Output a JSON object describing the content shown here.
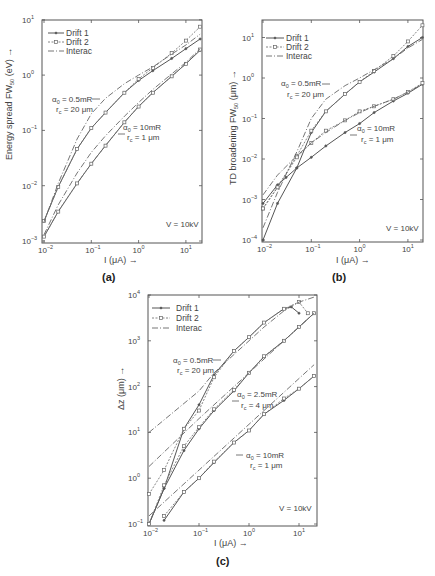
{
  "chart_data": [
    {
      "id": "a",
      "type": "line",
      "panel_label": "(a)",
      "title": "",
      "xlabel": "I (μA) →",
      "ylabel": "Energy spread FW50 (eV) →",
      "xscale": "log",
      "yscale": "log",
      "xlim": [
        0.009,
        22
      ],
      "ylim": [
        0.001,
        10
      ],
      "xticks": [
        "10^-2",
        "10^-1",
        "10^0",
        "10^1"
      ],
      "yticks": [
        "10^-3",
        "10^-2",
        "10^-1",
        "10^0",
        "10^1"
      ],
      "legend": [
        "Drift 1",
        "Drift 2",
        "Interac"
      ],
      "legend_position": "upper left",
      "annotations": [
        {
          "text": "α0 = 0.5mR",
          "sub": "rc = 20 μm"
        },
        {
          "text": "α0 = 10mR",
          "sub": "rc = 1 μm"
        },
        {
          "text": "V = 10kV"
        }
      ],
      "series": [
        {
          "name": "Drift 1 (α0=0.5mR)",
          "x": [
            0.01,
            0.02,
            0.05,
            0.1,
            0.2,
            0.5,
            1,
            2,
            5,
            10,
            20
          ],
          "y": [
            0.0023,
            0.0095,
            0.046,
            0.11,
            0.21,
            0.48,
            0.8,
            1.2,
            2.0,
            3.0,
            4.5
          ]
        },
        {
          "name": "Drift 2 (α0=0.5mR)",
          "x": [
            0.01,
            0.02,
            0.05,
            0.1,
            0.2,
            0.5,
            1,
            2,
            5,
            10,
            20
          ],
          "y": [
            0.0023,
            0.0095,
            0.046,
            0.11,
            0.21,
            0.48,
            0.85,
            1.35,
            2.5,
            4.2,
            7.5
          ]
        },
        {
          "name": "Interac (α0=0.5mR)",
          "x": [
            0.01,
            0.02,
            0.05,
            0.1,
            0.2,
            0.5,
            1,
            2,
            5,
            10,
            20
          ],
          "y": [
            0.0022,
            0.011,
            0.07,
            0.2,
            0.38,
            0.7,
            1.0,
            1.4,
            2.4,
            3.5,
            5.5
          ]
        },
        {
          "name": "Drift 1 (α0=10mR)",
          "x": [
            0.01,
            0.02,
            0.05,
            0.1,
            0.2,
            0.5,
            1,
            2,
            5,
            10,
            20
          ],
          "y": [
            0.0012,
            0.0034,
            0.011,
            0.025,
            0.053,
            0.14,
            0.27,
            0.48,
            0.95,
            1.6,
            2.8
          ]
        },
        {
          "name": "Drift 2 (α0=10mR)",
          "x": [
            0.01,
            0.02,
            0.05,
            0.1,
            0.2,
            0.5,
            1,
            2,
            5,
            10,
            20
          ],
          "y": [
            0.0012,
            0.0034,
            0.011,
            0.025,
            0.053,
            0.14,
            0.27,
            0.48,
            0.95,
            1.6,
            2.9
          ]
        },
        {
          "name": "Interac (α0=10mR)",
          "x": [
            0.01,
            0.02,
            0.05,
            0.1,
            0.2,
            0.5,
            1,
            2,
            5,
            10,
            20
          ],
          "y": [
            0.0013,
            0.0045,
            0.017,
            0.04,
            0.08,
            0.18,
            0.32,
            0.55,
            1.05,
            1.7,
            3.0
          ]
        }
      ]
    },
    {
      "id": "b",
      "type": "line",
      "panel_label": "(b)",
      "title": "",
      "xlabel": "I (μA) →",
      "ylabel": "TD broadening FW50 (μm) →",
      "xscale": "log",
      "yscale": "log",
      "xlim": [
        0.009,
        22
      ],
      "ylim": [
        0.0001,
        30
      ],
      "xticks": [
        "10^-2",
        "10^-1",
        "10^0",
        "10^1"
      ],
      "yticks": [
        "10^-4",
        "10^-3",
        "10^-2",
        "10^-1",
        "10^0",
        "10^1"
      ],
      "legend": [
        "Drift 1",
        "Drift 2",
        "Interac"
      ],
      "legend_position": "upper left",
      "annotations": [
        {
          "text": "α0 = 0.5mR",
          "sub": "rc = 20 μm"
        },
        {
          "text": "α0 = 10mR",
          "sub": "rc = 1 μm"
        },
        {
          "text": "V = 10kV"
        }
      ],
      "series": [
        {
          "name": "Drift 1 (α0=0.5mR)",
          "x": [
            0.01,
            0.02,
            0.05,
            0.1,
            0.2,
            0.5,
            1,
            2,
            5,
            10,
            20
          ],
          "y": [
            0.0001,
            0.0008,
            0.006,
            0.045,
            0.15,
            0.4,
            0.8,
            1.4,
            3.0,
            6.0,
            10.0
          ]
        },
        {
          "name": "Drift 2 (α0=0.5mR)",
          "x": [
            0.01,
            0.02,
            0.05,
            0.1,
            0.2,
            0.5,
            1,
            2,
            5,
            10,
            20
          ],
          "y": [
            0.0006,
            0.002,
            0.012,
            0.05,
            0.15,
            0.4,
            0.8,
            1.5,
            3.5,
            8.0,
            20.0
          ]
        },
        {
          "name": "Interac (α0=0.5mR)",
          "x": [
            0.01,
            0.02,
            0.05,
            0.1,
            0.2,
            0.5,
            1,
            2,
            5,
            10,
            20
          ],
          "y": [
            0.0002,
            0.0015,
            0.015,
            0.1,
            0.3,
            0.65,
            1.0,
            1.6,
            3.0,
            5.5,
            9.0
          ]
        },
        {
          "name": "Drift 1 (α0=10mR)",
          "x": [
            0.01,
            0.02,
            0.03,
            0.05,
            0.1,
            0.2,
            0.5,
            1,
            2,
            5,
            10,
            20
          ],
          "y": [
            0.0008,
            0.0023,
            0.0035,
            0.006,
            0.011,
            0.021,
            0.045,
            0.075,
            0.14,
            0.27,
            0.42,
            0.7
          ]
        },
        {
          "name": "Drift 2 (α0=10mR)",
          "x": [
            0.01,
            0.02,
            0.05,
            0.1,
            0.2,
            0.5,
            1,
            2,
            5,
            10,
            20
          ],
          "y": [
            0.0006,
            0.002,
            0.011,
            0.025,
            0.05,
            0.09,
            0.15,
            0.2,
            0.3,
            0.45,
            0.75
          ]
        },
        {
          "name": "Interac (α0=10mR)",
          "x": [
            0.01,
            0.02,
            0.05,
            0.1,
            0.2,
            0.5,
            1,
            2,
            5,
            10,
            20
          ],
          "y": [
            0.0013,
            0.004,
            0.012,
            0.025,
            0.045,
            0.09,
            0.14,
            0.2,
            0.3,
            0.45,
            0.7
          ]
        }
      ]
    },
    {
      "id": "c",
      "type": "line",
      "panel_label": "(c)",
      "title": "",
      "xlabel": "I (μA) →",
      "ylabel": "Δz (μm) →",
      "xscale": "log",
      "yscale": "log",
      "xlim": [
        0.009,
        22
      ],
      "ylim": [
        0.1,
        10000
      ],
      "xticks": [
        "10^-2",
        "10^-1",
        "10^0",
        "10^1"
      ],
      "yticks": [
        "10^-1",
        "10^0",
        "10^1",
        "10^2",
        "10^3",
        "10^4"
      ],
      "legend": [
        "Drift 1",
        "Drift 2",
        "Interac"
      ],
      "legend_position": "upper left",
      "annotations": [
        {
          "text": "α0 = 0.5mR",
          "sub": "rc = 20 μm"
        },
        {
          "text": "α0 = 2.5mR",
          "sub": "rc = 4 μm"
        },
        {
          "text": "α0 = 10mR",
          "sub": "rc = 1 μm"
        },
        {
          "text": "V = 10kV"
        }
      ],
      "series": [
        {
          "name": "Drift 1 (α0=0.5mR)",
          "x": [
            0.01,
            0.02,
            0.05,
            0.1,
            0.2,
            0.5,
            1,
            2,
            5,
            7,
            10
          ],
          "y": [
            0.1,
            0.6,
            12,
            40,
            180,
            600,
            1200,
            2500,
            5000,
            5500,
            4000
          ]
        },
        {
          "name": "Drift 2 (α0=0.5mR)",
          "x": [
            0.01,
            0.02,
            0.05,
            0.1,
            0.2,
            0.5,
            1,
            2,
            5,
            10,
            15
          ],
          "y": [
            0.45,
            1.5,
            12,
            30,
            160,
            600,
            1200,
            2500,
            5000,
            7000,
            4000
          ]
        },
        {
          "name": "Interac (α0=0.5mR)",
          "x": [
            0.01,
            0.1,
            0.2,
            0.5,
            1,
            2,
            5,
            10,
            20
          ],
          "y": [
            10,
            80,
            200,
            500,
            1000,
            2000,
            4500,
            7000,
            9000
          ]
        },
        {
          "name": "Drift 1 (α0=2.5mR)",
          "x": [
            0.01,
            0.02,
            0.05,
            0.1,
            0.2,
            0.5,
            1,
            2,
            5,
            10,
            20
          ],
          "y": [
            0.1,
            0.6,
            4,
            12,
            30,
            80,
            200,
            450,
            1000,
            2000,
            4000
          ]
        },
        {
          "name": "Drift 2 (α0=2.5mR)",
          "x": [
            0.01,
            0.02,
            0.05,
            0.1,
            0.2,
            0.5,
            1,
            2,
            5,
            10,
            20
          ],
          "y": [
            0.1,
            0.7,
            5,
            13,
            32,
            85,
            200,
            460,
            1000,
            2000,
            4000
          ]
        },
        {
          "name": "Interac (α0=2.5mR)",
          "x": [
            0.01,
            0.1,
            1,
            10,
            20
          ],
          "y": [
            1.8,
            20,
            200,
            2000,
            4000
          ]
        },
        {
          "name": "Drift 1 (α0=10mR)",
          "x": [
            0.02,
            0.05,
            0.1,
            0.2,
            0.5,
            1,
            2,
            5,
            10,
            20
          ],
          "y": [
            0.12,
            0.5,
            1.0,
            2.2,
            6,
            11,
            25,
            50,
            90,
            170
          ]
        },
        {
          "name": "Drift 2 (α0=10mR)",
          "x": [
            0.02,
            0.05,
            0.1,
            0.2,
            0.5,
            1,
            2,
            5,
            10,
            20
          ],
          "y": [
            0.15,
            0.5,
            1.0,
            2.3,
            6,
            11,
            25,
            55,
            90,
            170
          ]
        },
        {
          "name": "Interac (α0=10mR)",
          "x": [
            0.01,
            0.1,
            1,
            10,
            20
          ],
          "y": [
            0.15,
            1.5,
            15,
            150,
            300
          ]
        }
      ]
    }
  ],
  "ui": {
    "panel_a": {
      "label": "(a)",
      "ylabel": "Energy spread FW",
      "ylabel_sub": "50",
      "ylabel_unit": " (eV) →",
      "xlabel": "I (μA) →",
      "ann1_a": "α",
      "ann1_a_sub": "0",
      "ann1_val": " = 0.5mR",
      "ann1_r": "r",
      "ann1_r_sub": "c",
      "ann1_rval": " = 20 μm",
      "ann2_val": " = 10mR",
      "ann2_rval": " = 1 μm",
      "voltage": "V = 10kV"
    },
    "panel_b": {
      "label": "(b)",
      "ylabel": "TD broadening  FW",
      "ylabel_sub": "50",
      "ylabel_unit": " (μm) →",
      "xlabel": "I (μA) →",
      "ann1_val": " = 0.5mR",
      "ann1_rval": " = 20 μm",
      "ann2_val": " = 10mR",
      "ann2_rval": " = 1 μm",
      "voltage": "V = 10kV"
    },
    "panel_c": {
      "label": "(c)",
      "ylabel": "Δz (μm) →",
      "xlabel": "I (μA) →",
      "ann1_val": " = 0.5mR",
      "ann1_rval": " = 20 μm",
      "ann2_val": " = 2.5mR",
      "ann2_rval": " = 4 μm",
      "ann3_val": " = 10mR",
      "ann3_rval": " = 1 μm",
      "voltage": "V = 10kV"
    },
    "legend": {
      "drift1": "Drift 1",
      "drift2": "Drift 2",
      "interac": "Interac"
    },
    "tick_base": "10"
  }
}
